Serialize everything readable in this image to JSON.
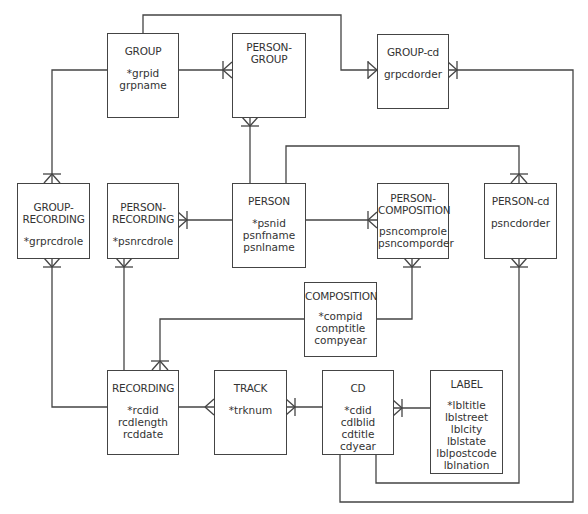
{
  "diagram": {
    "type": "entity-relationship",
    "colors": {
      "line": "#444444",
      "text": "#333333",
      "background": "#ffffff"
    },
    "entities": {
      "group": {
        "title": "GROUP",
        "attributes": [
          "*grpid",
          "grpname"
        ]
      },
      "person_group": {
        "title": "PERSON-\nGROUP",
        "attributes": []
      },
      "group_cd": {
        "title": "GROUP-cd",
        "attributes": [
          "grpcdorder"
        ]
      },
      "group_recording": {
        "title": "GROUP-\nRECORDING",
        "attributes": [
          "*grprcdrole"
        ]
      },
      "person_recording": {
        "title": "PERSON-\nRECORDING",
        "attributes": [
          "*psnrcdrole"
        ]
      },
      "person": {
        "title": "PERSON",
        "attributes": [
          "*psnid",
          "psnfname",
          "psnlname"
        ]
      },
      "person_composition": {
        "title": "PERSON-\nCOMPOSITION",
        "attributes": [
          "psncomprole",
          "psncomporder"
        ]
      },
      "person_cd": {
        "title": "PERSON-cd",
        "attributes": [
          "psncdorder"
        ]
      },
      "composition": {
        "title": "COMPOSITION",
        "attributes": [
          "*compid",
          "comptitle",
          "compyear"
        ]
      },
      "recording": {
        "title": "RECORDING",
        "attributes": [
          "*rcdid",
          "rcdlength",
          "rcddate"
        ]
      },
      "track": {
        "title": "TRACK",
        "attributes": [
          "*trknum"
        ]
      },
      "cd": {
        "title": "CD",
        "attributes": [
          "*cdid",
          "cdlblid",
          "cdtitle",
          "cdyear"
        ]
      },
      "label": {
        "title": "LABEL",
        "attributes": [
          "*lbltitle",
          "lblstreet",
          "lblcity",
          "lblstate",
          "lblpostcode",
          "lblnation"
        ]
      }
    },
    "relationships": [
      {
        "from": "GROUP",
        "to": "PERSON-GROUP",
        "cardinality": "1:M"
      },
      {
        "from": "PERSON",
        "to": "PERSON-GROUP",
        "cardinality": "1:M"
      },
      {
        "from": "GROUP",
        "to": "GROUP-cd",
        "cardinality": "1:M"
      },
      {
        "from": "CD",
        "to": "GROUP-cd",
        "cardinality": "1:M"
      },
      {
        "from": "GROUP",
        "to": "GROUP-RECORDING",
        "cardinality": "1:M"
      },
      {
        "from": "RECORDING",
        "to": "GROUP-RECORDING",
        "cardinality": "1:M"
      },
      {
        "from": "PERSON",
        "to": "PERSON-RECORDING",
        "cardinality": "1:M"
      },
      {
        "from": "RECORDING",
        "to": "PERSON-RECORDING",
        "cardinality": "1:M"
      },
      {
        "from": "PERSON",
        "to": "PERSON-COMPOSITION",
        "cardinality": "1:M"
      },
      {
        "from": "COMPOSITION",
        "to": "PERSON-COMPOSITION",
        "cardinality": "1:M"
      },
      {
        "from": "PERSON",
        "to": "PERSON-cd",
        "cardinality": "1:M"
      },
      {
        "from": "CD",
        "to": "PERSON-cd",
        "cardinality": "1:M"
      },
      {
        "from": "COMPOSITION",
        "to": "RECORDING",
        "cardinality": "1:M"
      },
      {
        "from": "RECORDING",
        "to": "TRACK",
        "cardinality": "1:M"
      },
      {
        "from": "CD",
        "to": "TRACK",
        "cardinality": "1:M"
      },
      {
        "from": "LABEL",
        "to": "CD",
        "cardinality": "1:M"
      }
    ]
  }
}
